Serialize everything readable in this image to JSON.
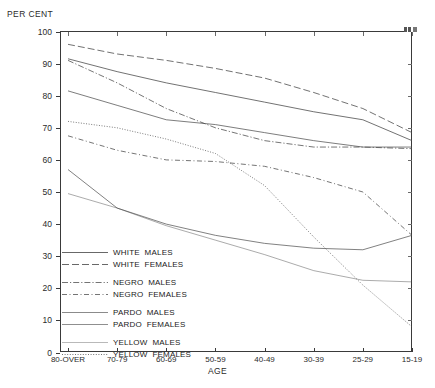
{
  "chart_data": {
    "type": "line",
    "title": "",
    "ylabel": "PER CENT",
    "xlabel": "AGE",
    "categories": [
      "80-OVER",
      "70-79",
      "60-69",
      "50-59",
      "40-49",
      "30-39",
      "25-29",
      "15-19"
    ],
    "ylim": [
      0,
      100
    ],
    "yticks": [
      0,
      10,
      20,
      30,
      40,
      50,
      60,
      70,
      80,
      90,
      100
    ],
    "grid": false,
    "legend_position": "lower-left-inside",
    "series": [
      {
        "name": "WHITE MALES",
        "style": "solid",
        "values": [
          91.5,
          87.5,
          84.0,
          81.0,
          78.0,
          75.0,
          72.5,
          66.0
        ]
      },
      {
        "name": "WHITE FEMALES",
        "style": "long-dash",
        "values": [
          96.0,
          93.0,
          91.0,
          88.5,
          85.5,
          81.0,
          76.0,
          68.5
        ]
      },
      {
        "name": "NEGRO MALES",
        "style": "dash-dot",
        "values": [
          91.0,
          84.0,
          76.0,
          70.0,
          66.0,
          64.0,
          64.0,
          63.5
        ]
      },
      {
        "name": "NEGRO FEMALES",
        "style": "dash-dot-dot",
        "values": [
          67.5,
          63.0,
          60.0,
          59.5,
          58.0,
          54.5,
          50.0,
          36.5
        ]
      },
      {
        "name": "PARDO MALES",
        "style": "thin-solid",
        "values": [
          81.5,
          77.0,
          72.5,
          71.0,
          68.5,
          66.0,
          64.0,
          64.0
        ]
      },
      {
        "name": "PARDO FEMALES",
        "style": "thin-solid-2",
        "values": [
          57.0,
          45.0,
          40.0,
          36.5,
          34.0,
          32.5,
          32.0,
          36.5
        ]
      },
      {
        "name": "YELLOW MALES",
        "style": "faint-solid",
        "values": [
          49.5,
          45.0,
          39.5,
          35.0,
          30.5,
          25.5,
          22.5,
          22.0
        ]
      },
      {
        "name": "YELLOW FEMALES",
        "style": "dotted",
        "values": [
          72.0,
          70.0,
          66.5,
          62.0,
          52.0,
          36.0,
          21.0,
          8.0
        ]
      }
    ]
  },
  "legend": {
    "groups": [
      {
        "items": [
          {
            "label": "WHITE  MALES",
            "style": "solid"
          },
          {
            "label": "WHITE  FEMALES",
            "style": "long-dash"
          }
        ]
      },
      {
        "items": [
          {
            "label": "NEGRO  MALES",
            "style": "dash-dot"
          },
          {
            "label": "NEGRO  FEMALES",
            "style": "dash-dot-dot"
          }
        ]
      },
      {
        "items": [
          {
            "label": "PARDO  MALES",
            "style": "thin-solid"
          },
          {
            "label": "PARDO  FEMALES",
            "style": "thin-solid-2"
          }
        ]
      },
      {
        "items": [
          {
            "label": "YELLOW  MALES",
            "style": "faint-solid"
          },
          {
            "label": "YELLOW  FEMALES",
            "style": "dotted"
          }
        ]
      }
    ]
  },
  "colors": {
    "axis": "#3a3a3a",
    "line": "#4a4a4a",
    "text": "#1a1a1a",
    "background": "#ffffff"
  }
}
